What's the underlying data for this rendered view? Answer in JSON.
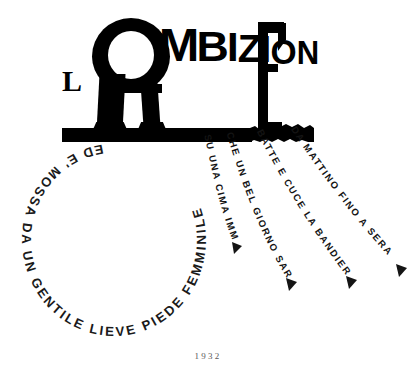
{
  "artwork": {
    "title_words": {
      "article": "L",
      "big_letter": "A",
      "middle": [
        "M",
        "B",
        "I",
        "Z",
        "I",
        "O",
        "N"
      ],
      "final_letter": "E",
      "full_title": "L'AMBIZIONE"
    },
    "year": "1932",
    "circular_text": "ED E' MOSSA DA UN GENTILE LIEVE PIEDE FEMMINILE",
    "rays": [
      {
        "id": "ray-1",
        "text": "SU UNA CIMA IMMACOLATA"
      },
      {
        "id": "ray-2",
        "text": "CHE UN BEL GIORNO SARA' ISSATA"
      },
      {
        "id": "ray-3",
        "text": "BATTE E CUCE LA BANDIERA"
      },
      {
        "id": "ray-4",
        "text": "DA MATTINO FINO A SERA"
      }
    ],
    "colors": {
      "ink": "#000000",
      "paper": "#ffffff",
      "text_ink": "#141414",
      "year_ink": "#5a5a5a"
    }
  }
}
